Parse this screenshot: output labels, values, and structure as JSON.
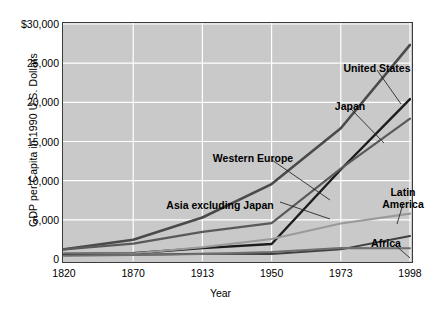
{
  "chart_data": {
    "type": "line",
    "title": "",
    "xlabel": "Year",
    "ylabel": "GDP per Capita in 1990 U.S. Dollars",
    "x": [
      1820,
      1870,
      1913,
      1950,
      1973,
      1998
    ],
    "categories": [
      "1820",
      "1870",
      "1913",
      "1950",
      "1973",
      "1998"
    ],
    "xtick_labels": [
      "1820",
      "1870",
      "1913",
      "1950",
      "1973",
      "1998"
    ],
    "ytick_labels": [
      "$30,000",
      "25,000",
      "20,000",
      "15,000",
      "10,000",
      "5,000",
      "0"
    ],
    "ytick_values": [
      30000,
      25000,
      20000,
      15000,
      10000,
      5000,
      0
    ],
    "ylim": [
      0,
      30000
    ],
    "grid": true,
    "legend": "annotated-inline",
    "plot_background": "#c9c9c9",
    "gridline_color": "#ffffff",
    "frame_color": "#3c3c3c",
    "series": [
      {
        "name": "United States",
        "color": "#4a4a4a",
        "width": 2.6,
        "values": [
          1250,
          2450,
          5300,
          9560,
          16690,
          27330
        ]
      },
      {
        "name": "Japan",
        "color": "#1c1c1c",
        "width": 2.4,
        "values": [
          670,
          740,
          1390,
          1920,
          11430,
          20410
        ]
      },
      {
        "name": "Western Europe",
        "color": "#5a5a5a",
        "width": 2.2,
        "values": [
          1230,
          1970,
          3470,
          4590,
          11530,
          17920
        ]
      },
      {
        "name": "Latin America",
        "color": "#9a9a9a",
        "width": 2.2,
        "values": [
          700,
          700,
          1500,
          2550,
          4530,
          5800
        ]
      },
      {
        "name": "Asia excluding Japan",
        "color": "#3f3f3f",
        "width": 2.0,
        "values": [
          580,
          550,
          660,
          640,
          1230,
          2940
        ]
      },
      {
        "name": "Africa",
        "color": "#6e6e6e",
        "width": 2.0,
        "values": [
          420,
          500,
          640,
          890,
          1410,
          1370
        ]
      }
    ],
    "annotations": [
      {
        "name": "United States",
        "label": "United States",
        "x": 377,
        "y": 62,
        "align": "center",
        "leader": {
          "x1": 377,
          "y1": 70,
          "x2": 401,
          "y2": 104
        }
      },
      {
        "name": "Japan",
        "label": "Japan",
        "x": 350,
        "y": 100,
        "align": "center",
        "leader": {
          "x1": 350,
          "y1": 108,
          "x2": 384,
          "y2": 143
        }
      },
      {
        "name": "Western Europe",
        "label": "Western Europe",
        "x": 253,
        "y": 152,
        "align": "center",
        "leader": {
          "x1": 272,
          "y1": 160,
          "x2": 330,
          "y2": 200
        }
      },
      {
        "name": "Asia excluding Japan",
        "label": "Asia excluding Japan",
        "x": 220,
        "y": 199,
        "align": "center",
        "leader": {
          "x1": 280,
          "y1": 202,
          "x2": 330,
          "y2": 219
        }
      },
      {
        "name": "Latin America",
        "label": "Latin\nAmerica",
        "x": 403,
        "y": 186,
        "align": "center",
        "leader": {
          "x1": 403,
          "y1": 204,
          "x2": 397,
          "y2": 224
        }
      },
      {
        "name": "Africa",
        "label": "Africa",
        "x": 386,
        "y": 237,
        "align": "center",
        "leader": {
          "x1": 394,
          "y1": 244,
          "x2": 410,
          "y2": 258
        }
      }
    ]
  }
}
